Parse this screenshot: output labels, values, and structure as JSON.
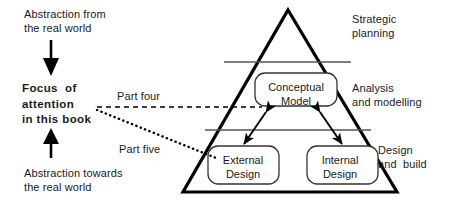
{
  "diagram": {
    "left_annotations": [
      {
        "name": "abstraction-from",
        "text": "Abstraction from\nthe real world",
        "bold": false
      },
      {
        "name": "focus-of-attention",
        "text": "Focus  of\nattention\nin this book",
        "bold": true
      },
      {
        "name": "abstraction-towards",
        "text": "Abstraction towards\nthe real world",
        "bold": false
      }
    ],
    "connector_labels": [
      {
        "name": "part-four",
        "text": "Part four",
        "style": "dashed",
        "target": "Conceptual Model"
      },
      {
        "name": "part-five",
        "text": "Part five",
        "style": "dotted",
        "target": "External Design"
      }
    ],
    "right_annotations": [
      {
        "name": "strategic-planning",
        "text": "Strategic\nplanning",
        "tier": 1
      },
      {
        "name": "analysis-and-modelling",
        "text": "Analysis\nand modelling",
        "tier": 2
      },
      {
        "name": "design-and-build",
        "text": "Design\nand  build",
        "tier": 3
      }
    ],
    "pyramid": {
      "tiers": [
        {
          "name": "tier-strategic-planning",
          "label": "Strategic planning"
        },
        {
          "name": "tier-analysis-and-modelling",
          "label": "Analysis and modelling"
        },
        {
          "name": "tier-design-and-build",
          "label": "Design and build"
        }
      ],
      "boxes": [
        {
          "name": "conceptual-model-box",
          "text": "Conceptual\nModel"
        },
        {
          "name": "external-design-box",
          "text": "External\nDesign"
        },
        {
          "name": "internal-design-box",
          "text": "Internal\nDesign"
        }
      ],
      "connections": [
        {
          "from": "External Design",
          "to": "Conceptual Model",
          "style": "double-headed-arrow"
        },
        {
          "from": "Internal Design",
          "to": "Conceptual Model",
          "style": "double-headed-arrow"
        }
      ]
    },
    "arrows": [
      {
        "name": "down-arrow",
        "direction": "down",
        "meaning": "Abstraction from the real world"
      },
      {
        "name": "up-arrow",
        "direction": "up",
        "meaning": "Abstraction towards the real world"
      }
    ],
    "colors": {
      "background": "#ffffff",
      "ink": "#1a1a1a",
      "line": "#000000",
      "thin_line": "#555555"
    }
  }
}
